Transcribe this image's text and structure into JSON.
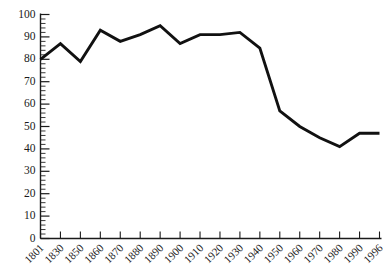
{
  "chart_data": {
    "type": "line",
    "title": "",
    "subtitle": "",
    "xlabel": "",
    "ylabel": "",
    "categories": [
      "1801",
      "1830",
      "1850",
      "1860",
      "1870",
      "1880",
      "1890",
      "1900",
      "1910",
      "1920",
      "1930",
      "1940",
      "1950",
      "1960",
      "1970",
      "1980",
      "1990",
      "1996"
    ],
    "values": [
      80,
      87,
      79,
      93,
      88,
      91,
      95,
      87,
      91,
      91,
      92,
      85,
      57,
      50,
      45,
      41,
      47,
      47
    ],
    "series": [
      {
        "name": "",
        "values": [
          80,
          87,
          79,
          93,
          88,
          91,
          95,
          87,
          91,
          91,
          92,
          85,
          57,
          50,
          45,
          41,
          47,
          47
        ]
      }
    ],
    "ylim": [
      0,
      100
    ],
    "y_ticks": [
      0,
      10,
      20,
      30,
      40,
      50,
      60,
      70,
      80,
      90,
      100
    ],
    "y_tick_labels": [
      "0",
      "10",
      "20",
      "30",
      "40",
      "50",
      "60",
      "70",
      "80",
      "90",
      "100"
    ],
    "y_minor_tick_step": 2,
    "x_tick_labels": [
      "1801",
      "1830",
      "1850",
      "1860",
      "1870",
      "1880",
      "1890",
      "1900",
      "1910",
      "1920",
      "1930",
      "1940",
      "1950",
      "1960",
      "1970",
      "1980",
      "1990",
      "1996"
    ],
    "grid": false,
    "legend": null,
    "legend_position": "none",
    "line_color": "#111111",
    "axis_color": "#1a1a1a",
    "background_color": "#ffffff",
    "x_label_rotation_deg": -45
  }
}
